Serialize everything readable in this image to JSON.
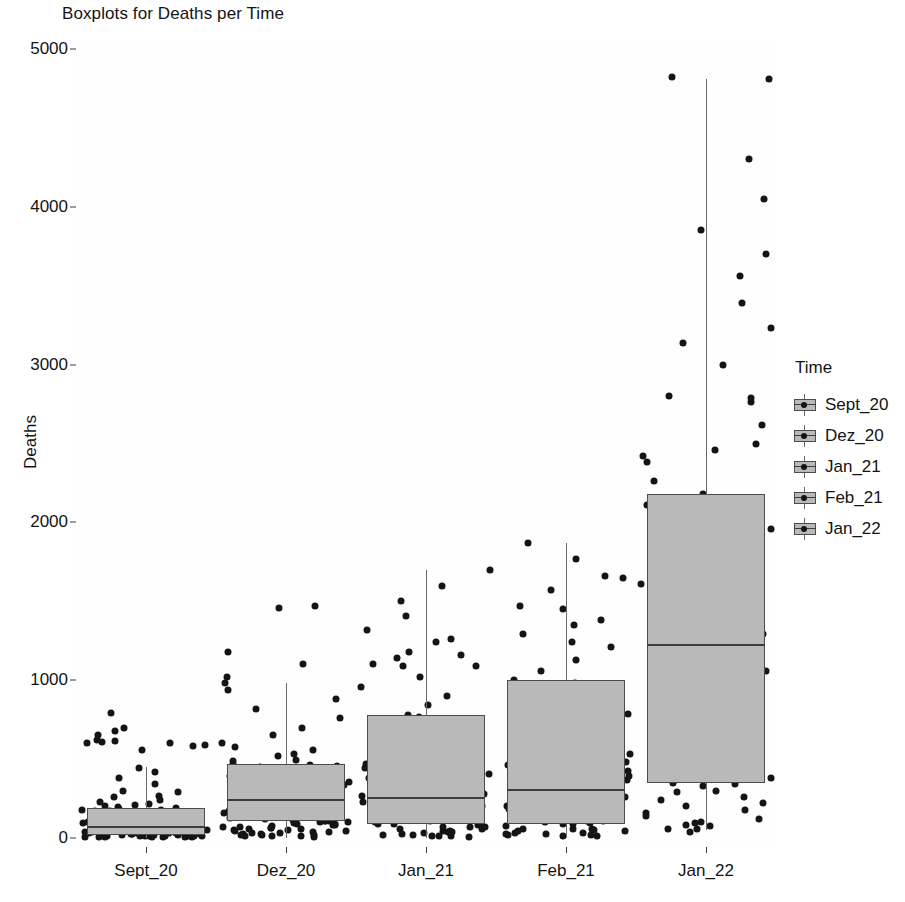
{
  "chart_data": {
    "type": "boxplot",
    "title": "Boxplots for Deaths per Time",
    "xlabel": "",
    "ylabel": "Deaths",
    "categories": [
      "Sept_20",
      "Dez_20",
      "Jan_21",
      "Feb_21",
      "Jan_22"
    ],
    "ylim": [
      0,
      5000
    ],
    "yticks": [
      0,
      1000,
      2000,
      3000,
      4000,
      5000
    ],
    "ytick_labels": [
      "0",
      "1000",
      "2000",
      "3000",
      "4000",
      "5000"
    ],
    "grid": false,
    "legend": {
      "title": "Time",
      "position": "right",
      "entries": [
        "Sept_20",
        "Dez_20",
        "Jan_21",
        "Feb_21",
        "Jan_22"
      ]
    },
    "overlay": "jittered points",
    "colors": {
      "box_fill": "#b9b9b9",
      "box_border": "#4c4c4c",
      "median": "#3d3d3d",
      "whisker": "#6a6a6a",
      "point": "#141414",
      "panel_background": "#fefefe",
      "text": "#141414"
    },
    "boxes": [
      {
        "category": "Sept_20",
        "q1": 20,
        "median": 75,
        "q3": 190,
        "whisker_low": 0,
        "whisker_high": 450
      },
      {
        "category": "Dez_20",
        "q1": 110,
        "median": 250,
        "q3": 470,
        "whisker_low": 0,
        "whisker_high": 980
      },
      {
        "category": "Jan_21",
        "q1": 90,
        "median": 260,
        "q3": 780,
        "whisker_low": 0,
        "whisker_high": 1700
      },
      {
        "category": "Feb_21",
        "q1": 90,
        "median": 310,
        "q3": 1000,
        "whisker_low": 0,
        "whisker_high": 1870
      },
      {
        "category": "Jan_22",
        "q1": 350,
        "median": 1230,
        "q3": 2180,
        "whisker_low": 50,
        "whisker_high": 4810
      }
    ],
    "points": {
      "Sept_20": [
        20,
        18,
        15,
        12,
        30,
        25,
        10,
        8,
        45,
        60,
        35,
        22,
        14,
        28,
        55,
        70,
        18,
        12,
        9,
        40,
        105,
        130,
        160,
        185,
        210,
        95,
        75,
        62,
        48,
        33,
        26,
        19,
        11,
        7,
        5,
        52,
        88,
        115,
        145,
        175,
        230,
        260,
        300,
        340,
        380,
        420,
        445,
        560,
        580,
        590,
        600,
        605,
        610,
        615,
        620,
        650,
        680,
        700,
        790,
        24,
        16,
        31,
        44,
        58,
        66,
        82,
        99,
        118,
        137,
        155,
        172,
        195,
        215,
        240,
        268,
        292,
        6,
        9,
        13,
        17,
        21,
        27,
        36,
        42,
        50,
        57,
        64,
        73,
        85,
        96,
        108,
        123,
        140,
        158,
        178,
        200,
        8,
        11,
        14,
        23,
        29,
        38,
        47,
        54,
        68,
        80,
        92,
        104,
        120,
        135,
        150,
        168,
        188
      ],
      "Dez_20": [
        40,
        65,
        90,
        110,
        135,
        160,
        185,
        210,
        240,
        270,
        300,
        330,
        360,
        390,
        420,
        450,
        470,
        490,
        25,
        18,
        12,
        50,
        78,
        102,
        128,
        155,
        180,
        205,
        232,
        258,
        285,
        310,
        340,
        370,
        400,
        430,
        460,
        520,
        560,
        600,
        650,
        700,
        760,
        820,
        880,
        940,
        980,
        1020,
        1100,
        1180,
        1460,
        1470,
        15,
        22,
        33,
        46,
        58,
        72,
        86,
        99,
        115,
        142,
        168,
        195,
        222,
        248,
        275,
        302,
        328,
        355,
        382,
        8,
        13,
        20,
        28,
        36,
        44,
        53,
        62,
        70,
        84,
        94,
        106,
        118,
        130,
        144,
        158,
        172,
        186,
        200,
        30,
        55,
        80,
        105,
        130,
        155,
        190,
        225,
        260,
        295,
        335,
        375,
        415,
        455,
        495,
        535,
        575
      ],
      "Jan_21": [
        35,
        70,
        105,
        140,
        175,
        210,
        245,
        280,
        315,
        350,
        390,
        430,
        470,
        510,
        550,
        590,
        630,
        670,
        710,
        750,
        780,
        20,
        15,
        10,
        55,
        88,
        122,
        158,
        192,
        228,
        264,
        298,
        334,
        370,
        406,
        442,
        478,
        514,
        550,
        840,
        900,
        960,
        1020,
        1090,
        1160,
        1240,
        1320,
        1410,
        1500,
        1600,
        1700,
        1140,
        1180,
        1260,
        25,
        45,
        68,
        92,
        118,
        146,
        174,
        202,
        230,
        258,
        286,
        314,
        342,
        372,
        402,
        8,
        12,
        18,
        30,
        42,
        56,
        72,
        88,
        104,
        122,
        140,
        160,
        180,
        200,
        222,
        244,
        268,
        292,
        40,
        85,
        130,
        178,
        226,
        276,
        326,
        378,
        430,
        484,
        538,
        594,
        650,
        708,
        766,
        1090,
        1105
      ],
      "Feb_21": [
        45,
        90,
        135,
        180,
        230,
        280,
        330,
        380,
        430,
        480,
        530,
        580,
        630,
        680,
        730,
        780,
        830,
        880,
        930,
        980,
        1000,
        25,
        18,
        12,
        60,
        105,
        152,
        200,
        248,
        296,
        344,
        392,
        440,
        488,
        536,
        584,
        632,
        680,
        728,
        1060,
        1130,
        1210,
        1290,
        1380,
        1470,
        1570,
        1660,
        1770,
        1870,
        1450,
        1650,
        1240,
        1350,
        30,
        58,
        88,
        118,
        150,
        182,
        214,
        248,
        282,
        316,
        352,
        388,
        424,
        462,
        500,
        10,
        16,
        24,
        34,
        46,
        60,
        76,
        92,
        110,
        128,
        148,
        168,
        190,
        212,
        236,
        260,
        286,
        312,
        50,
        100,
        150,
        202,
        256,
        310,
        366,
        422,
        480,
        540,
        600,
        662,
        724,
        788,
        854,
        920
      ],
      "Jan_22": [
        380,
        460,
        540,
        620,
        700,
        790,
        880,
        970,
        1060,
        1150,
        1230,
        1320,
        1410,
        1510,
        1610,
        1710,
        1810,
        1910,
        2010,
        2110,
        2180,
        340,
        300,
        260,
        220,
        180,
        140,
        100,
        60,
        40,
        2260,
        2380,
        2500,
        2620,
        2760,
        2800,
        2790,
        2460,
        2420,
        3000,
        3140,
        3230,
        3390,
        3560,
        3700,
        3850,
        4050,
        4300,
        4820,
        4810,
        420,
        500,
        590,
        680,
        770,
        860,
        950,
        1040,
        1140,
        1250,
        1360,
        1470,
        1580,
        1690,
        1800,
        1920,
        2040,
        350,
        390,
        450,
        520,
        610,
        720,
        830,
        940,
        1050,
        1170,
        1290,
        1420,
        1550,
        1680,
        1820,
        1960,
        2100,
        80,
        120,
        160,
        200,
        240,
        290,
        330,
        370,
        55,
        75,
        95
      ]
    }
  }
}
